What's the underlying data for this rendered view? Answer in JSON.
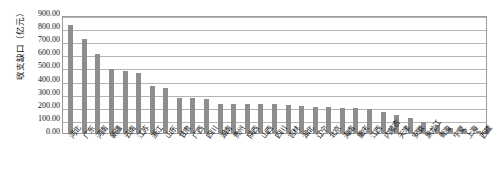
{
  "chart_data": {
    "type": "bar",
    "title": "",
    "xlabel": "",
    "ylabel": "收支缺口（亿元）",
    "ylim": [
      0,
      900
    ],
    "ytick_labels": [
      "900.00",
      "800.00",
      "700.00",
      "600.00",
      "500.00",
      "400.00",
      "300.00",
      "200.00",
      "100.00",
      "0.00"
    ],
    "ytick_values": [
      900,
      800,
      700,
      600,
      500,
      400,
      300,
      200,
      100,
      0
    ],
    "grid": true,
    "legend": "none",
    "bar_color": "#8e8e8e",
    "categories": [
      "河北",
      "广东",
      "河南",
      "新疆",
      "云南",
      "江苏",
      "浙江",
      "山东",
      "甘肃",
      "广西",
      "四川",
      "湖南",
      "贵州",
      "陕西",
      "山西",
      "四川",
      "吉林",
      "湖北",
      "辽宁",
      "北京",
      "海南",
      "重庆",
      "江西",
      "内蒙古",
      "天津",
      "安徽",
      "黑龙江",
      "青海",
      "宁夏",
      "上海",
      "西藏"
    ],
    "values": [
      825,
      715,
      605,
      490,
      475,
      458,
      355,
      340,
      268,
      270,
      262,
      222,
      222,
      222,
      220,
      218,
      212,
      205,
      198,
      195,
      192,
      188,
      185,
      160,
      140,
      112,
      85,
      60,
      40,
      28,
      15
    ]
  }
}
